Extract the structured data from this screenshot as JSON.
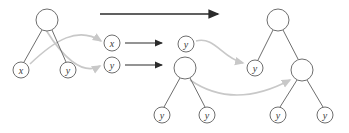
{
  "diagram": {
    "colors": {
      "node_stroke": "#6e6e6e",
      "edge_stroke": "#6e6e6e",
      "label_fill": "#3a3a3a",
      "arrow_dark": "#2b2b2b",
      "arrow_light": "#c8c8c8",
      "background": "#ffffff"
    },
    "labels": {
      "x": "x",
      "y": "y",
      "empty": ""
    },
    "left_tree": {
      "name": "source-tree",
      "nodes": [
        {
          "id": "L-root",
          "label": "",
          "cx": 47,
          "cy": 20,
          "r": 11
        },
        {
          "id": "L-left",
          "label": "x",
          "cx": 21,
          "cy": 70,
          "r": 8
        },
        {
          "id": "L-right",
          "label": "y",
          "cx": 68,
          "cy": 70,
          "r": 8
        }
      ],
      "edges": [
        {
          "from": "L-root",
          "to": "L-left"
        },
        {
          "from": "L-root",
          "to": "L-right"
        }
      ]
    },
    "middle_nodes": {
      "name": "extracted-nodes",
      "nodes": [
        {
          "id": "M-x",
          "label": "x",
          "cx": 112,
          "cy": 43,
          "r": 8
        },
        {
          "id": "M-y",
          "label": "y",
          "cx": 112,
          "cy": 65,
          "r": 8
        }
      ]
    },
    "middle_subtree": {
      "name": "intermediate-subtree",
      "nodes": [
        {
          "id": "S-root",
          "label": "",
          "cx": 185,
          "cy": 68,
          "r": 11
        },
        {
          "id": "S-left",
          "label": "y",
          "cx": 162,
          "cy": 115,
          "r": 8
        },
        {
          "id": "S-right",
          "label": "y",
          "cx": 207,
          "cy": 115,
          "r": 8
        }
      ],
      "edges": [
        {
          "from": "S-root",
          "to": "S-left"
        },
        {
          "from": "S-root",
          "to": "S-right"
        }
      ]
    },
    "middle_leaf": {
      "name": "floating-y-node",
      "nodes": [
        {
          "id": "F-y",
          "label": "y",
          "cx": 186,
          "cy": 44,
          "r": 8
        }
      ]
    },
    "right_tree": {
      "name": "result-tree",
      "nodes": [
        {
          "id": "R-root",
          "label": "",
          "cx": 278,
          "cy": 20,
          "r": 11
        },
        {
          "id": "R-left",
          "label": "y",
          "cx": 255,
          "cy": 68,
          "r": 8
        },
        {
          "id": "R-right",
          "label": "",
          "cx": 302,
          "cy": 70,
          "r": 11
        },
        {
          "id": "R-right-l",
          "label": "y",
          "cx": 278,
          "cy": 115,
          "r": 8
        },
        {
          "id": "R-right-r",
          "label": "y",
          "cx": 325,
          "cy": 115,
          "r": 8
        }
      ],
      "edges": [
        {
          "from": "R-root",
          "to": "R-left"
        },
        {
          "from": "R-root",
          "to": "R-right"
        },
        {
          "from": "R-right",
          "to": "R-right-l"
        },
        {
          "from": "R-right",
          "to": "R-right-r"
        }
      ]
    },
    "arrows_dark": [
      {
        "id": "A-top",
        "name": "transform-arrow",
        "x1": 100,
        "y1": 14,
        "x2": 222,
        "y2": 14
      },
      {
        "id": "A-mid1",
        "name": "map-arrow-x",
        "x1": 125,
        "y1": 43,
        "x2": 166,
        "y2": 43
      },
      {
        "id": "A-mid2",
        "name": "map-arrow-y",
        "x1": 125,
        "y1": 65,
        "x2": 166,
        "y2": 65
      }
    ],
    "arrows_light": [
      {
        "id": "C-1",
        "name": "move-x-from-left-child",
        "path": "M 30 64 C 55 40, 78 26, 101 41"
      },
      {
        "id": "C-2",
        "name": "move-y-from-right-child",
        "path": "M 46 30 C 62 56, 82 76, 100 66"
      },
      {
        "id": "C-3",
        "name": "move-y-into-left-slot",
        "path": "M 196 41 C 215 36, 222 58, 243 63"
      },
      {
        "id": "C-4",
        "name": "move-subtree-into-right",
        "path": "M 190 80 C 225 104, 260 96, 290 80"
      }
    ]
  }
}
